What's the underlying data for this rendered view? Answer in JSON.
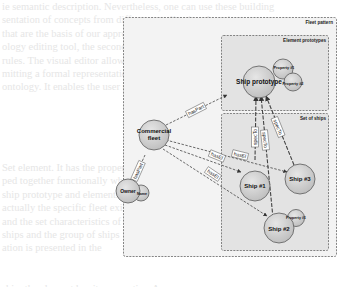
{
  "diagram": {
    "frames": [
      {
        "id": "fleet-pattern",
        "label": "Fleet pattern"
      },
      {
        "id": "element-prototypes",
        "label": "Element prototypes"
      },
      {
        "id": "set-of-ships",
        "label": "Set of ships"
      }
    ],
    "nodes": [
      {
        "id": "ship-prototype",
        "label": "Ship prototype"
      },
      {
        "id": "property-1-proto",
        "label": "Property #1"
      },
      {
        "id": "property-2-proto",
        "label": "Property #2"
      },
      {
        "id": "commercial-fleet",
        "label_line1": "Commercial",
        "label_line2": "fleet"
      },
      {
        "id": "owner",
        "label": "Owner"
      },
      {
        "id": "name",
        "label": "Name"
      },
      {
        "id": "ship-1",
        "label": "Ship #1"
      },
      {
        "id": "ship-2",
        "label": "Ship #2"
      },
      {
        "id": "ship-3",
        "label": "Ship #3"
      },
      {
        "id": "property-1-ship2",
        "label": "Property #1"
      }
    ],
    "edges": [
      {
        "from": "commercial-fleet",
        "to": "ship-prototype",
        "label": "hasPart"
      },
      {
        "from": "commercial-fleet",
        "to": "owner",
        "label": "hasPart"
      },
      {
        "from": "commercial-fleet",
        "to": "ship-1",
        "label": "hasEl"
      },
      {
        "from": "commercial-fleet",
        "to": "ship-3",
        "label": "hasEl"
      },
      {
        "from": "commercial-fleet",
        "to": "ship-2",
        "label": "hasEl"
      },
      {
        "from": "ship-1",
        "to": "ship-prototype",
        "label": "specTo"
      },
      {
        "from": "ship-2",
        "to": "ship-prototype",
        "label": "specTo"
      },
      {
        "from": "ship-3",
        "to": "ship-prototype",
        "label": "specTo"
      }
    ],
    "colors": {
      "node_fill": "#d4d4d4",
      "node_stroke": "#5a5a5a",
      "frame_fill": "#f2f2f2",
      "inner_frame_fill": "#e4e4e4",
      "frame_stroke": "#666666"
    }
  },
  "background_text": [
    "ie semantic description. Nevertheless, one can use these building",
    "sentation of concepts from different application domains",
    "that are the basis of our approach. The first tool, the visual",
    "ology editing tool, the second tool, the OWL and a",
    "rules. The visual editor allows the specification of design",
    "mitting a formal representation of the design patterns",
    "ontology. It enables the user to create, process and",
    "",
    "",
    "",
    "",
    "",
    "Set element. It has the properties. A fleet is a group",
    "ped together functionally while we",
    "ship prototype and elements are its",
    "actually the specific fleet exists",
    "and the set characteristics of",
    "ships and the group of ships",
    "ation is presented in the",
    "",
    "",
    "ship, the element has its properties. Any"
  ]
}
